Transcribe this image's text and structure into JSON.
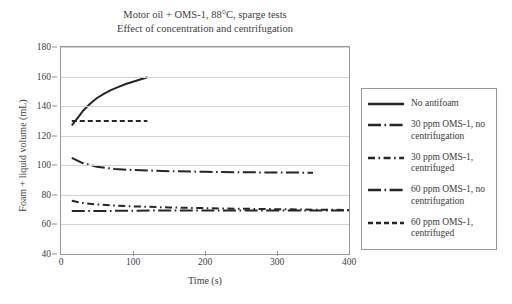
{
  "chart_data": {
    "type": "line",
    "title": "Motor oil + OMS-1, 88°C, sparge tests",
    "subtitle": "Effect of concentration and centrifugation",
    "xlabel": "Time (s)",
    "ylabel": "Foam + liquid volume (mL)",
    "xlim": [
      0,
      400
    ],
    "ylim": [
      40,
      180
    ],
    "xticks": [
      "0",
      "100",
      "200",
      "300",
      "400"
    ],
    "xtick_values": [
      0,
      100,
      200,
      300,
      400
    ],
    "yticks": [
      "40",
      "60",
      "80",
      "100",
      "120",
      "140",
      "160",
      "180"
    ],
    "ytick_values": [
      40,
      60,
      80,
      100,
      120,
      140,
      160,
      180
    ],
    "grid": "horizontal",
    "legend_position": "right-outside",
    "line_color": "#262626",
    "grid_color": "#d2d2d2",
    "series": [
      {
        "name": "No antifoam",
        "style": "solid",
        "x": [
          15,
          20,
          30,
          40,
          50,
          60,
          70,
          80,
          90,
          100,
          110,
          120
        ],
        "y": [
          127,
          130,
          136.5,
          141.5,
          145.5,
          148.5,
          151,
          153,
          155,
          156.5,
          158,
          159.5
        ]
      },
      {
        "name": "30 ppm OMS-1, no centrifugation",
        "style": "longdash-dot",
        "x": [
          15,
          30,
          50,
          75,
          100,
          150,
          200,
          250,
          300,
          350
        ],
        "y": [
          105,
          101.5,
          99,
          97.5,
          96.8,
          96,
          95.6,
          95.3,
          95.1,
          95
        ]
      },
      {
        "name": "30 ppm OMS-1, centrifuged",
        "style": "dash-dot",
        "x": [
          15,
          30,
          50,
          75,
          100,
          150,
          200,
          250,
          300,
          350,
          400
        ],
        "y": [
          76,
          74.5,
          73.5,
          72.8,
          72.2,
          71.5,
          71,
          70.6,
          70.3,
          70,
          69.8
        ]
      },
      {
        "name": "60 ppm OMS-1, no centrifugation",
        "style": "longdash-dot",
        "x": [
          15,
          30,
          50,
          75,
          100,
          150,
          200,
          250,
          300,
          350,
          400
        ],
        "y": [
          69,
          69,
          69,
          69.2,
          69.3,
          69.4,
          69.5,
          69.5,
          69.5,
          69.5,
          69.5
        ]
      },
      {
        "name": "60 ppm OMS-1, centrifuged",
        "style": "dashed",
        "x": [
          15,
          40,
          70,
          100,
          120
        ],
        "y": [
          130,
          130,
          130,
          130,
          130
        ]
      }
    ]
  },
  "legend": {
    "entries": [
      {
        "label": "No antifoam",
        "style": "solid"
      },
      {
        "label": "30 ppm OMS-1, no centrifugation",
        "style": "longdash-dot"
      },
      {
        "label": "30 ppm OMS-1, centrifuged",
        "style": "dash-dot"
      },
      {
        "label": "60 ppm OMS-1, no centrifugation",
        "style": "longdash-dot"
      },
      {
        "label": "60 ppm OMS-1, centrifuged",
        "style": "dashed"
      }
    ]
  }
}
